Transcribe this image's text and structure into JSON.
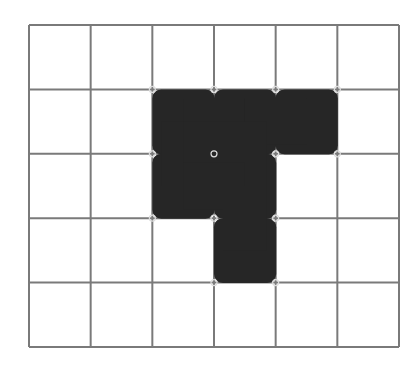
{
  "diagram": {
    "type": "grid-polyomino",
    "grid": {
      "columns": 6,
      "rows": 5,
      "left": 29,
      "top": 25,
      "right": 399,
      "bottom": 347,
      "line_color": "#7a7a7a",
      "line_width": 2
    },
    "shape": {
      "name": "pentomino",
      "fill_color": "#262626",
      "cells": [
        {
          "row": 1,
          "col": 2
        },
        {
          "row": 1,
          "col": 3
        },
        {
          "row": 1,
          "col": 4
        },
        {
          "row": 2,
          "col": 2
        },
        {
          "row": 2,
          "col": 3
        },
        {
          "row": 3,
          "col": 3
        }
      ],
      "corner_radius": 9
    },
    "background_color": "#ffffff"
  }
}
